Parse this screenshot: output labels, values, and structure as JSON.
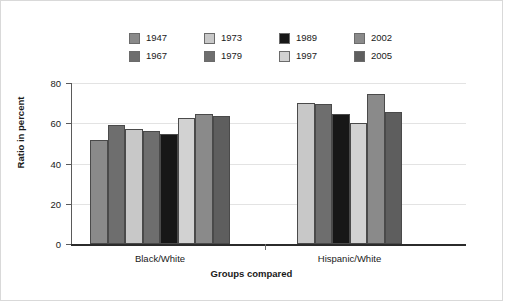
{
  "chart_data": {
    "type": "bar",
    "title": "",
    "subtitle": "",
    "xlabel": "Groups compared",
    "ylabel": "Ratio in percent",
    "categories": [
      "Black/White",
      "Hispanic/White"
    ],
    "ylim": [
      0,
      80
    ],
    "yticks": [
      0,
      20,
      40,
      60,
      80
    ],
    "ytick_labels": [
      "0",
      "20",
      "40",
      "60",
      "80"
    ],
    "grid": true,
    "legend_position": "top",
    "series": [
      {
        "name": "1947",
        "color": "#8a8a8a",
        "values": [
          51.7,
          null
        ]
      },
      {
        "name": "1967",
        "color": "#6e6e6e",
        "values": [
          59.0,
          null
        ]
      },
      {
        "name": "1973",
        "color": "#c8c8c8",
        "values": [
          57.0,
          70.0
        ]
      },
      {
        "name": "1979",
        "color": "#6e6e6e",
        "values": [
          56.0,
          69.8
        ]
      },
      {
        "name": "1989",
        "color": "#171717",
        "values": [
          54.8,
          64.8
        ]
      },
      {
        "name": "1997",
        "color": "#d2d2d2",
        "values": [
          62.5,
          60.0
        ]
      },
      {
        "name": "2002",
        "color": "#8a8a8a",
        "values": [
          64.5,
          74.5
        ]
      },
      {
        "name": "2005",
        "color": "#5e5e5e",
        "values": [
          63.5,
          65.5
        ]
      }
    ]
  },
  "legend": {
    "rows": [
      [
        {
          "label": "1947",
          "color": "#8a8a8a"
        },
        {
          "label": "1973",
          "color": "#c8c8c8"
        },
        {
          "label": "1989",
          "color": "#171717"
        },
        {
          "label": "2002",
          "color": "#8a8a8a"
        }
      ],
      [
        {
          "label": "1967",
          "color": "#6e6e6e"
        },
        {
          "label": "1979",
          "color": "#6e6e6e"
        },
        {
          "label": "1997",
          "color": "#d2d2d2"
        },
        {
          "label": "2005",
          "color": "#5e5e5e"
        }
      ]
    ]
  },
  "axes": {
    "y_title": "Ratio in percent",
    "x_title": "Groups compared",
    "y_tick_labels": [
      "80",
      "60",
      "40",
      "20",
      "0"
    ],
    "group_labels": [
      "Black/White",
      "Hispanic/White"
    ]
  }
}
